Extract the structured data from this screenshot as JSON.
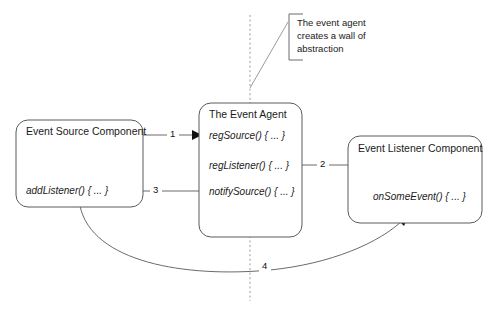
{
  "diagram": {
    "colors": {
      "box_stroke": "#5a5a5a",
      "connector": "#6b6b6b",
      "dashed_wall": "#9a9a9a",
      "text": "#1a1a1a",
      "background": "#ffffff"
    },
    "boxes": [
      {
        "id": "event-source-component",
        "title": "Event Source Component",
        "method": "addListener() { ... }"
      },
      {
        "id": "the-event-agent",
        "title": "The Event Agent",
        "methods": [
          "regSource() { ... }",
          "regListener() { ... }",
          "notifySource() { ... }"
        ]
      },
      {
        "id": "event-listener-component",
        "title": "Event Listener Component",
        "method": "onSomeEvent() { ... }"
      }
    ],
    "arrows": [
      {
        "id": "arrow-1",
        "label": "1"
      },
      {
        "id": "arrow-2",
        "label": "2"
      },
      {
        "id": "arrow-3",
        "label": "3"
      },
      {
        "id": "arrow-4",
        "label": "4"
      }
    ],
    "callout": {
      "id": "abstraction-wall-callout",
      "lines": [
        "The event agent",
        "creates a wall of",
        "abstraction"
      ]
    }
  }
}
